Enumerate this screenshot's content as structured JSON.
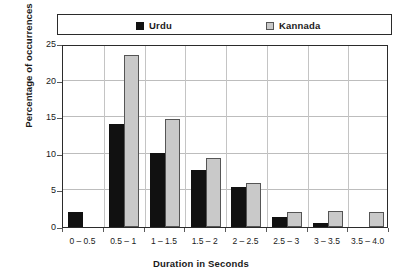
{
  "chart_data": {
    "type": "bar",
    "title": "",
    "xlabel": "Duration in Seconds",
    "ylabel": "Percentage of occurrences",
    "categories": [
      "0 – 0.5",
      "0.5 – 1",
      "1 – 1.5",
      "1.5 – 2",
      "2 – 2.5",
      "2.5 – 3",
      "3 – 3.5",
      "3.5 – 4.0"
    ],
    "series": [
      {
        "name": "Urdu",
        "color": "#111111",
        "values": [
          2.0,
          14.1,
          10.1,
          7.8,
          5.4,
          1.3,
          0.6,
          0
        ]
      },
      {
        "name": "Kannada",
        "color": "#c9c9c9",
        "values": [
          0,
          23.5,
          14.8,
          9.4,
          6.0,
          2.0,
          2.2,
          2.0
        ]
      }
    ],
    "ylim": [
      0,
      25
    ],
    "yticks": [
      0,
      5,
      10,
      15,
      20,
      25
    ],
    "ytick_labels": [
      "0",
      "5",
      "10",
      "15",
      "20",
      "25"
    ],
    "grid": true,
    "legend_position": "top"
  },
  "legend": {
    "items": [
      {
        "label": "Urdu",
        "swatch": "filled-black-square"
      },
      {
        "label": "Kannada",
        "swatch": "outlined-gray-square"
      }
    ]
  }
}
